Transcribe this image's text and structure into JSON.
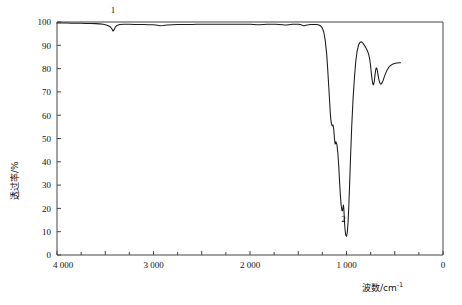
{
  "figure": {
    "title": "",
    "y_axis_title": "透过率/%",
    "x_axis_title_main": "波数/cm",
    "x_axis_title_exp": "-1",
    "peak_label_1": "1",
    "peak_label_2": "2",
    "curve_color": "#1a1a1a",
    "axis_color": "#444444"
  },
  "x_ticks": [
    {
      "value": 4000,
      "label": "4 000"
    },
    {
      "value": 3500,
      "label": ""
    },
    {
      "value": 3000,
      "label": "3 000"
    },
    {
      "value": 2500,
      "label": ""
    },
    {
      "value": 2000,
      "label": "2 000"
    },
    {
      "value": 1500,
      "label": ""
    },
    {
      "value": 1000,
      "label": "1 000"
    },
    {
      "value": 500,
      "label": ""
    },
    {
      "value": 0,
      "label": "0"
    }
  ],
  "y_ticks": [
    {
      "value": 100,
      "label": "100"
    },
    {
      "value": 90,
      "label": "90"
    },
    {
      "value": 80,
      "label": "80"
    },
    {
      "value": 70,
      "label": "70"
    },
    {
      "value": 60,
      "label": "60"
    },
    {
      "value": 50,
      "label": "50"
    },
    {
      "value": 40,
      "label": "40"
    },
    {
      "value": 30,
      "label": "30"
    },
    {
      "value": 20,
      "label": "20"
    },
    {
      "value": 10,
      "label": "10"
    },
    {
      "value": 0,
      "label": "0"
    }
  ],
  "chart_data": {
    "type": "line",
    "title": "",
    "xlabel": "波数/cm-1",
    "ylabel": "透过率/%",
    "xlim": [
      4000,
      0
    ],
    "ylim": [
      0,
      100
    ],
    "x_inverted": true,
    "grid": false,
    "legend": null,
    "annotations": [
      {
        "label": "1",
        "x": 3420,
        "y": 96,
        "note": "weak broad O-H / N-H band"
      },
      {
        "label": "2",
        "x": 1030,
        "y": 8,
        "note": "strongest absorption band"
      }
    ],
    "series": [
      {
        "name": "transmittance",
        "x": [
          4000,
          3950,
          3900,
          3850,
          3800,
          3750,
          3700,
          3650,
          3600,
          3560,
          3520,
          3480,
          3450,
          3430,
          3420,
          3410,
          3395,
          3380,
          3350,
          3300,
          3250,
          3200,
          3150,
          3100,
          3050,
          3000,
          2960,
          2930,
          2900,
          2860,
          2800,
          2750,
          2700,
          2650,
          2600,
          2550,
          2500,
          2450,
          2400,
          2350,
          2300,
          2250,
          2200,
          2150,
          2100,
          2050,
          2000,
          1960,
          1930,
          1900,
          1860,
          1820,
          1780,
          1740,
          1700,
          1660,
          1640,
          1620,
          1600,
          1580,
          1560,
          1540,
          1520,
          1500,
          1480,
          1465,
          1455,
          1448,
          1440,
          1430,
          1420,
          1405,
          1390,
          1370,
          1350,
          1330,
          1310,
          1295,
          1280,
          1265,
          1250,
          1235,
          1220,
          1205,
          1195,
          1185,
          1175,
          1168,
          1162,
          1155,
          1148,
          1140,
          1132,
          1125,
          1118,
          1110,
          1100,
          1090,
          1080,
          1072,
          1064,
          1056,
          1048,
          1042,
          1036,
          1032,
          1028,
          1024,
          1020,
          1014,
          1008,
          1000,
          992,
          984,
          976,
          968,
          958,
          946,
          932,
          918,
          904,
          890,
          876,
          862,
          848,
          836,
          824,
          812,
          800,
          790,
          782,
          776,
          770,
          764,
          758,
          752,
          746,
          740,
          734,
          728,
          722,
          716,
          710,
          704,
          698,
          692,
          686,
          680,
          672,
          664,
          656,
          648,
          640,
          630,
          620,
          610,
          600,
          588,
          576,
          564,
          552,
          540,
          528,
          516,
          504,
          492,
          480,
          470,
          460,
          450,
          440
        ],
        "y": [
          99.6,
          99.6,
          99.6,
          99.5,
          99.5,
          99.5,
          99.4,
          99.4,
          99.3,
          99.2,
          99.0,
          98.6,
          98.0,
          97.0,
          96.1,
          96.6,
          97.8,
          98.5,
          98.9,
          99.0,
          99.0,
          98.9,
          98.9,
          98.9,
          98.8,
          98.8,
          98.6,
          98.4,
          98.5,
          98.7,
          98.8,
          98.9,
          98.9,
          98.9,
          98.9,
          99.0,
          99.0,
          99.0,
          99.0,
          99.0,
          99.0,
          99.0,
          99.0,
          99.0,
          99.0,
          99.0,
          99.0,
          98.9,
          98.8,
          98.8,
          98.9,
          99.0,
          99.0,
          99.0,
          98.9,
          98.8,
          98.7,
          98.7,
          98.8,
          98.9,
          99.0,
          99.0,
          99.0,
          99.0,
          98.9,
          98.7,
          98.5,
          98.4,
          98.4,
          98.5,
          98.6,
          98.7,
          98.8,
          98.9,
          98.9,
          98.9,
          98.9,
          98.8,
          98.6,
          98.2,
          97.4,
          95.6,
          92.0,
          86.0,
          80.0,
          73.0,
          66.0,
          61.0,
          58.0,
          56.2,
          55.4,
          55.8,
          54.0,
          50.0,
          47.6,
          48.6,
          47.6,
          44.0,
          38.0,
          31.5,
          26.0,
          21.5,
          19.2,
          19.0,
          20.5,
          21.4,
          20.0,
          17.0,
          13.5,
          10.5,
          8.6,
          8.0,
          9.6,
          14.0,
          21.0,
          30.0,
          42.0,
          55.0,
          67.0,
          76.0,
          83.0,
          87.5,
          90.0,
          91.2,
          91.5,
          91.2,
          90.6,
          89.8,
          89.0,
          88.2,
          87.5,
          86.8,
          86.0,
          85.0,
          83.6,
          81.8,
          79.4,
          77.0,
          75.0,
          73.6,
          73.0,
          73.6,
          75.2,
          77.4,
          79.3,
          80.3,
          80.2,
          79.0,
          77.0,
          75.2,
          74.0,
          73.4,
          73.4,
          74.0,
          75.0,
          76.2,
          77.4,
          78.6,
          79.6,
          80.4,
          81.0,
          81.4,
          81.8,
          82.0,
          82.2,
          82.3,
          82.4,
          82.4,
          82.5,
          82.5,
          82.5
        ]
      }
    ]
  }
}
